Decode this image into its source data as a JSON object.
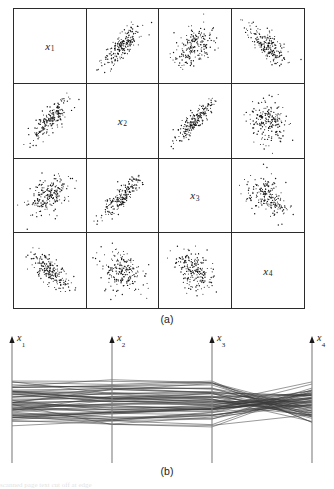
{
  "figure": {
    "panels": [
      {
        "id": "a",
        "caption": "(a)",
        "type": "scatter-plot-matrix"
      },
      {
        "id": "b",
        "caption": "(b)",
        "type": "parallel-coordinates"
      }
    ]
  },
  "variables": [
    {
      "key": "x1",
      "base": "x",
      "sub": "1",
      "label": "x1"
    },
    {
      "key": "x2",
      "base": "x",
      "sub": "2",
      "label": "x2"
    },
    {
      "key": "x3",
      "base": "x",
      "sub": "3",
      "label": "x3"
    },
    {
      "key": "x4",
      "base": "x",
      "sub": "4",
      "label": "x4"
    }
  ],
  "scatter_matrix": {
    "caption": "(a)",
    "rows": 4,
    "cols": 4,
    "diagonal_labels": [
      "x1",
      "x2",
      "x3",
      "x4"
    ],
    "n_points_per_cell": 200,
    "cells": [
      {
        "row": 0,
        "col": 0,
        "kind": "diagonal",
        "label": "x1"
      },
      {
        "row": 0,
        "col": 1,
        "kind": "scatter",
        "xvar": "x2",
        "yvar": "x1",
        "correlation": 0.78
      },
      {
        "row": 0,
        "col": 2,
        "kind": "scatter",
        "xvar": "x3",
        "yvar": "x1",
        "correlation": 0.45
      },
      {
        "row": 0,
        "col": 3,
        "kind": "scatter",
        "xvar": "x4",
        "yvar": "x1",
        "correlation": -0.72
      },
      {
        "row": 1,
        "col": 0,
        "kind": "scatter",
        "xvar": "x1",
        "yvar": "x2",
        "correlation": 0.78
      },
      {
        "row": 1,
        "col": 1,
        "kind": "diagonal",
        "label": "x2"
      },
      {
        "row": 1,
        "col": 2,
        "kind": "scatter",
        "xvar": "x3",
        "yvar": "x2",
        "correlation": 0.85
      },
      {
        "row": 1,
        "col": 3,
        "kind": "scatter",
        "xvar": "x4",
        "yvar": "x2",
        "correlation": -0.15
      },
      {
        "row": 2,
        "col": 0,
        "kind": "scatter",
        "xvar": "x1",
        "yvar": "x3",
        "correlation": 0.45
      },
      {
        "row": 2,
        "col": 1,
        "kind": "scatter",
        "xvar": "x2",
        "yvar": "x3",
        "correlation": 0.85
      },
      {
        "row": 2,
        "col": 2,
        "kind": "diagonal",
        "label": "x3"
      },
      {
        "row": 2,
        "col": 3,
        "kind": "scatter",
        "xvar": "x4",
        "yvar": "x3",
        "correlation": -0.35
      },
      {
        "row": 3,
        "col": 0,
        "kind": "scatter",
        "xvar": "x1",
        "yvar": "x4",
        "correlation": -0.72
      },
      {
        "row": 3,
        "col": 1,
        "kind": "scatter",
        "xvar": "x2",
        "yvar": "x4",
        "correlation": -0.15
      },
      {
        "row": 3,
        "col": 2,
        "kind": "scatter",
        "xvar": "x3",
        "yvar": "x4",
        "correlation": -0.35
      },
      {
        "row": 3,
        "col": 3,
        "kind": "diagonal",
        "label": "x4"
      }
    ]
  },
  "parallel_coordinates": {
    "caption": "(b)",
    "axes": [
      {
        "label": "x1",
        "x": 12
      },
      {
        "label": "x2",
        "x": 112
      },
      {
        "label": "x3",
        "x": 212
      },
      {
        "label": "x4",
        "x": 312
      }
    ],
    "n_lines": 60,
    "axis_top_y": 8,
    "axis_bottom_y": 130,
    "arrowhead": true,
    "line_color": "#3a3a3a"
  },
  "chart_data": {
    "type": "scatter",
    "title": "",
    "xlabel": "",
    "ylabel": "",
    "grid": false,
    "legend": false,
    "variables": [
      "x1",
      "x2",
      "x3",
      "x4"
    ],
    "correlation_matrix": [
      [
        1.0,
        0.78,
        0.45,
        -0.72
      ],
      [
        0.78,
        1.0,
        0.85,
        -0.15
      ],
      [
        0.45,
        0.85,
        1.0,
        -0.35
      ],
      [
        -0.72,
        -0.15,
        -0.35,
        1.0
      ]
    ],
    "n_observations": 200,
    "panels": [
      {
        "id": "a",
        "type": "scatter",
        "title": "(a)",
        "description": "4x4 scatter plot matrix of x1..x4 with variable names on the diagonal"
      },
      {
        "id": "b",
        "type": "line",
        "title": "(b)",
        "description": "parallel coordinates plot with four vertical axes x1, x2, x3, x4",
        "axis_labels": [
          "x1",
          "x2",
          "x3",
          "x4"
        ],
        "n_series": 60,
        "ylim": [
          0,
          1
        ]
      }
    ]
  },
  "colors": {
    "ink": "#1a1a1a",
    "frame": "#2b2b2b",
    "point": "#111111",
    "line": "#3a3a3a",
    "axis": "#808080",
    "background": "#ffffff"
  },
  "bottom_strip": {
    "text": "scanned page text cut off at edge"
  }
}
